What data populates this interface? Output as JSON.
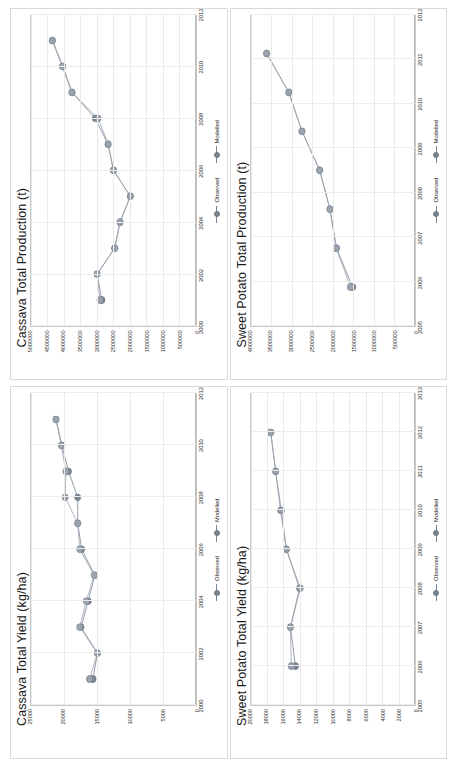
{
  "figure": {
    "layout": "2x2 grid of line charts",
    "legend_labels": {
      "observed": "Observed",
      "modelled": "Modelled"
    },
    "colors": {
      "observed": "#7a8594",
      "modelled": "#9aa3ae",
      "grid": "#e9e9e9",
      "axis": "#b9b9b9",
      "text": "#2a2a2a"
    }
  },
  "chart_data": [
    {
      "id": "cassava-yield",
      "type": "line",
      "title": "Cassava Total Yield (kg/ha)",
      "xlabel": "",
      "ylabel": "",
      "grid": true,
      "legend_position": "bottom",
      "xlim": [
        2000,
        2012
      ],
      "ylim": [
        0,
        25000
      ],
      "xticks": [
        "2000",
        "2002",
        "2004",
        "2006",
        "2008",
        "2010",
        "2012"
      ],
      "yticks": [
        "0",
        "5000",
        "10000",
        "15000",
        "20000",
        "25000"
      ],
      "x": [
        2001,
        2001,
        2002,
        2003,
        2004,
        2005,
        2006,
        2007,
        2008,
        2009,
        2010,
        2011
      ],
      "series": [
        {
          "name": "Observed",
          "values": [
            15600,
            15600,
            14900,
            17400,
            16300,
            15300,
            17300,
            17900,
            17900,
            19300,
            20300,
            21200
          ]
        },
        {
          "name": "Modelled",
          "values": [
            16100,
            16100,
            14900,
            17600,
            16600,
            15400,
            17600,
            17900,
            19800,
            19700,
            20400,
            21200
          ]
        }
      ]
    },
    {
      "id": "cassava-production",
      "type": "line",
      "title": "Cassava Total Production (t)",
      "xlabel": "",
      "ylabel": "",
      "grid": true,
      "legend_position": "bottom",
      "xlim": [
        2000,
        2012
      ],
      "ylim": [
        0,
        5000000
      ],
      "xticks": [
        "2000",
        "2002",
        "2004",
        "2006",
        "2008",
        "2010",
        "2012"
      ],
      "yticks": [
        "0",
        "500000",
        "1000000",
        "1500000",
        "2000000",
        "2500000",
        "3000000",
        "3500000",
        "4000000",
        "4500000",
        "5000000"
      ],
      "x": [
        2001,
        2001,
        2002,
        2003,
        2004,
        2005,
        2006,
        2007,
        2008,
        2009,
        2010,
        2011
      ],
      "series": [
        {
          "name": "Observed",
          "values": [
            2850000,
            2850000,
            2990000,
            2460000,
            2290000,
            1980000,
            2490000,
            2660000,
            3050000,
            3750000,
            4030000,
            4350000
          ]
        },
        {
          "name": "Modelled",
          "values": [
            2900000,
            2900000,
            2990000,
            2450000,
            2300000,
            1980000,
            2500000,
            2650000,
            2960000,
            3760000,
            4050000,
            4350000
          ]
        }
      ]
    },
    {
      "id": "sweet-potato-yield",
      "type": "line",
      "title": "Sweet Potato Total Yield (kg/ha)",
      "xlabel": "",
      "ylabel": "",
      "grid": true,
      "legend_position": "bottom",
      "xlim": [
        2005,
        2013
      ],
      "ylim": [
        0,
        20000
      ],
      "xticks": [
        "2005",
        "2006",
        "2007",
        "2008",
        "2009",
        "2010",
        "2011",
        "2012",
        "2013"
      ],
      "yticks": [
        "0",
        "2000",
        "4000",
        "6000",
        "8000",
        "10000",
        "12000",
        "14000",
        "16000",
        "18000",
        "20000"
      ],
      "x": [
        2006,
        2006,
        2007,
        2008,
        2009,
        2010,
        2011,
        2012
      ],
      "series": [
        {
          "name": "Observed",
          "values": [
            14600,
            14600,
            15200,
            14100,
            15700,
            16400,
            17000,
            17600
          ]
        },
        {
          "name": "Modelled",
          "values": [
            15100,
            15100,
            15200,
            14000,
            15700,
            16300,
            17000,
            17600
          ]
        }
      ]
    },
    {
      "id": "sweet-potato-production",
      "type": "line",
      "title": "Sweet Potato Total Production (t)",
      "xlabel": "",
      "ylabel": "",
      "grid": true,
      "legend_position": "bottom",
      "xlim": [
        2005,
        2013
      ],
      "ylim": [
        0,
        4000000
      ],
      "xticks": [
        "2005",
        "2006",
        "2007",
        "2008",
        "2009",
        "2010",
        "2011",
        "2012"
      ],
      "yticks": [
        "0",
        "500000",
        "1000000",
        "1500000",
        "2000000",
        "2500000",
        "3000000",
        "3500000",
        "4000000"
      ],
      "x": [
        2006,
        2006,
        2007,
        2008,
        2009,
        2010,
        2011,
        2012
      ],
      "series": [
        {
          "name": "Observed",
          "values": [
            1530000,
            1530000,
            1920000,
            2080000,
            2330000,
            2760000,
            3080000,
            3620000
          ]
        },
        {
          "name": "Modelled",
          "values": [
            1580000,
            1580000,
            1930000,
            2080000,
            2330000,
            2760000,
            3080000,
            3620000
          ]
        }
      ]
    }
  ]
}
